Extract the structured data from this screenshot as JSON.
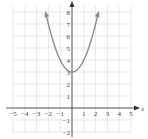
{
  "chart_data": {
    "type": "line",
    "title": "",
    "xlabel": "x",
    "ylabel": "y",
    "xlim": [
      -5,
      5
    ],
    "ylim": [
      -2,
      8
    ],
    "grid": true,
    "x_ticks": [
      "-5",
      "-4",
      "-3",
      "-2",
      "-1",
      "1",
      "2",
      "3",
      "4",
      "5"
    ],
    "y_ticks": [
      "-2",
      "-1",
      "1",
      "2",
      "3",
      "4",
      "5",
      "6",
      "7",
      "8"
    ],
    "series": [
      {
        "name": "y = x^2 + 3",
        "x": [
          -2.2,
          -2,
          -1.5,
          -1,
          -0.5,
          0,
          0.5,
          1,
          1.5,
          2,
          2.2
        ],
        "y": [
          7.84,
          7,
          5.25,
          4,
          3.25,
          3,
          3.25,
          4,
          5.25,
          7,
          7.84
        ],
        "arrows_at_ends": true,
        "color": "#8c8c8c"
      }
    ],
    "vertex": {
      "x": 0,
      "y": 3
    }
  },
  "labels": {
    "x_axis": "x",
    "y_axis": "y"
  },
  "colors": {
    "grid": "#d9d9d9",
    "axis": "#333333",
    "curve": "#8c8c8c"
  }
}
